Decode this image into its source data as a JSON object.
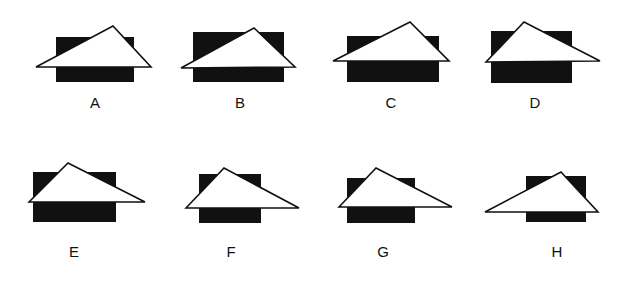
{
  "figures": [
    {
      "id": "A",
      "label": "A"
    },
    {
      "id": "B",
      "label": "B"
    },
    {
      "id": "C",
      "label": "C"
    },
    {
      "id": "D",
      "label": "D"
    },
    {
      "id": "E",
      "label": "E"
    },
    {
      "id": "F",
      "label": "F"
    },
    {
      "id": "G",
      "label": "G"
    },
    {
      "id": "H",
      "label": "H"
    }
  ],
  "colors": {
    "shape_fill_dark": "#111111",
    "shape_fill_light": "#ffffff",
    "background": "#ffffff"
  }
}
